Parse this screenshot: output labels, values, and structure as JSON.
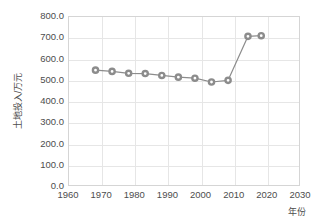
{
  "chart_data": {
    "type": "line",
    "title": "",
    "xlabel": "年份",
    "ylabel": "土地投入/万元",
    "xlim": [
      1960,
      2030
    ],
    "ylim": [
      0,
      800
    ],
    "xticks": [
      1960,
      1970,
      1980,
      1990,
      2000,
      2010,
      2020,
      2030
    ],
    "xtick_labels": [
      "1960",
      "1970",
      "1980",
      "1990",
      "2000",
      "2010",
      "2020",
      "2030"
    ],
    "yticks": [
      0,
      100,
      200,
      300,
      400,
      500,
      600,
      700,
      800
    ],
    "ytick_labels": [
      "0.0",
      "100.0",
      "200.0",
      "300.0",
      "400.0",
      "500.0",
      "600.0",
      "700.0",
      "800.0"
    ],
    "grid": true,
    "legend": "none",
    "x": [
      1968,
      1973,
      1978,
      1983,
      1988,
      1993,
      1998,
      2003,
      2008,
      2014,
      2018
    ],
    "values": [
      550,
      544,
      535,
      534,
      525,
      517,
      512,
      494,
      502,
      709,
      712
    ],
    "series": [
      {
        "name": "土地投入",
        "x": [
          1968,
          1973,
          1978,
          1983,
          1988,
          1993,
          1998,
          2003,
          2008,
          2014,
          2018
        ],
        "values": [
          550,
          544,
          535,
          534,
          525,
          517,
          512,
          494,
          502,
          709,
          712
        ],
        "line_color": "#8c8c8c",
        "marker": "circle-open",
        "marker_face_color": "#ffffff",
        "marker_edge_color": "#8c8c8c"
      }
    ],
    "colors": {
      "line": "#8c8c8c",
      "grid": "#e6e6e6",
      "frame": "#d5d5d5",
      "text": "#4d4d4d",
      "background": "#ffffff"
    }
  }
}
